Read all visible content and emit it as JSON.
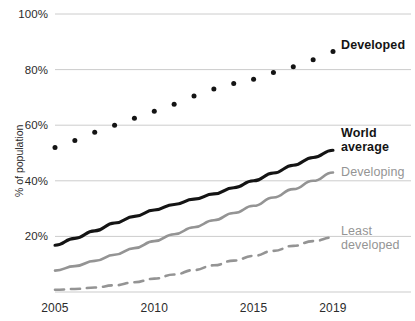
{
  "chart_data": {
    "type": "line",
    "title": "",
    "xlabel": "",
    "ylabel": "% of population",
    "xlim": [
      2005,
      2019
    ],
    "ylim": [
      0,
      100
    ],
    "grid": true,
    "legend_position": "right-inline",
    "x": [
      2005,
      2006,
      2007,
      2008,
      2009,
      2010,
      2011,
      2012,
      2013,
      2014,
      2015,
      2016,
      2017,
      2018,
      2019
    ],
    "xticks": [
      "2005",
      "2010",
      "2015",
      "2019"
    ],
    "xtick_values": [
      2005,
      2010,
      2015,
      2019
    ],
    "yticks": [
      "20%",
      "40%",
      "60%",
      "80%",
      "100%"
    ],
    "ytick_values": [
      20,
      40,
      60,
      80,
      100
    ],
    "series": [
      {
        "name": "Developed",
        "label_lines": [
          "Developed"
        ],
        "style": "dotted",
        "color": "#141414",
        "emphasis": "bold",
        "values": [
          52.0,
          54.5,
          57.5,
          60.0,
          62.5,
          65.0,
          67.5,
          70.5,
          73.0,
          75.0,
          76.5,
          79.0,
          81.0,
          83.5,
          86.5
        ]
      },
      {
        "name": "World average",
        "label_lines": [
          "World",
          "average"
        ],
        "style": "solid",
        "color": "#141414",
        "emphasis": "bold",
        "values": [
          16.8,
          19.3,
          22.0,
          24.8,
          27.2,
          29.5,
          31.5,
          33.4,
          35.3,
          37.5,
          40.0,
          42.8,
          45.6,
          48.4,
          51.0
        ]
      },
      {
        "name": "Developing",
        "label_lines": [
          "Developing"
        ],
        "style": "solid",
        "color": "#949494",
        "emphasis": "muted",
        "values": [
          7.7,
          9.3,
          11.2,
          13.4,
          15.8,
          18.3,
          20.8,
          23.3,
          25.8,
          28.4,
          31.0,
          34.0,
          37.0,
          40.0,
          43.0
        ]
      },
      {
        "name": "Least developed",
        "label_lines": [
          "Least",
          "developed"
        ],
        "style": "dashed",
        "color": "#949494",
        "emphasis": "muted",
        "values": [
          0.8,
          1.1,
          1.6,
          2.4,
          3.5,
          4.8,
          6.3,
          7.9,
          9.6,
          11.3,
          13.0,
          14.8,
          16.6,
          18.3,
          19.6
        ]
      }
    ]
  },
  "colors": {
    "ink": "#141414",
    "muted": "#949494",
    "grid": "#cccccc",
    "background": "#ffffff"
  }
}
